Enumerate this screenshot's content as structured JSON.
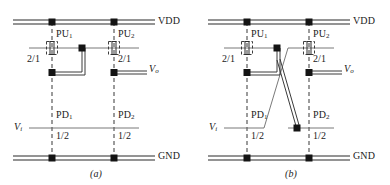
{
  "figure": {
    "panels": [
      {
        "id": "a",
        "caption": "(a)",
        "rails": {
          "vdd_label": "VDD",
          "gnd_label": "GND"
        },
        "nets": {
          "input_label": "V",
          "input_sub": "i",
          "output_label": "V",
          "output_sub": "o"
        },
        "devices": [
          {
            "name": "PU",
            "sub": "1",
            "ratio": "2/1",
            "type": "pull-up"
          },
          {
            "name": "PU",
            "sub": "2",
            "ratio": "2/1",
            "type": "pull-up"
          },
          {
            "name": "PD",
            "sub": "1",
            "ratio": "1/2",
            "type": "pull-down"
          },
          {
            "name": "PD",
            "sub": "2",
            "ratio": "1/2",
            "type": "pull-down"
          }
        ]
      },
      {
        "id": "b",
        "caption": "(b)",
        "rails": {
          "vdd_label": "VDD",
          "gnd_label": "GND"
        },
        "nets": {
          "input_label": "V",
          "input_sub": "i",
          "output_label": "V",
          "output_sub": "o"
        },
        "devices": [
          {
            "name": "PU",
            "sub": "1",
            "ratio": "2/1",
            "type": "pull-up"
          },
          {
            "name": "PU",
            "sub": "2",
            "ratio": "2/1",
            "type": "pull-up"
          },
          {
            "name": "PD",
            "sub": "1",
            "ratio": "1/2",
            "type": "pull-down"
          },
          {
            "name": "PD",
            "sub": "2",
            "ratio": "1/2",
            "type": "pull-down"
          }
        ]
      }
    ],
    "colors": {
      "wire": "#3a3a3a",
      "rail": "#2b2b2b",
      "dashed": "#4a4a4a",
      "node": "#141414",
      "background": "#ffffff"
    }
  },
  "panel_a": {
    "vdd": "VDD",
    "gnd": "GND",
    "pu1_name": "PU",
    "pu1_sub": "1",
    "pu1_ratio": "2/1",
    "pu2_name": "PU",
    "pu2_sub": "2",
    "pu2_ratio": "2/1",
    "pd1_name": "PD",
    "pd1_sub": "1",
    "pd1_ratio": "1/2",
    "pd2_name": "PD",
    "pd2_sub": "2",
    "pd2_ratio": "1/2",
    "vi": "V",
    "vi_sub": "i",
    "vo": "V",
    "vo_sub": "o",
    "caption": "(a)"
  },
  "panel_b": {
    "vdd": "VDD",
    "gnd": "GND",
    "pu1_name": "PU",
    "pu1_sub": "1",
    "pu1_ratio": "2/1",
    "pu2_name": "PU",
    "pu2_sub": "2",
    "pu2_ratio": "2/1",
    "pd1_name": "PD",
    "pd1_sub": "1",
    "pd1_ratio": "1/2",
    "pd2_name": "PD",
    "pd2_sub": "2",
    "pd2_ratio": "1/2",
    "vi": "V",
    "vi_sub": "i",
    "vo": "V",
    "vo_sub": "o",
    "caption": "(b)"
  }
}
